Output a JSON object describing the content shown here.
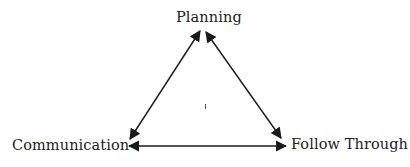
{
  "diagram": {
    "type": "triangle-relationship",
    "nodes": [
      {
        "id": "planning",
        "label": "Planning"
      },
      {
        "id": "communication",
        "label": "Communication"
      },
      {
        "id": "follow_through",
        "label": "Follow Through"
      }
    ],
    "edges": [
      {
        "from": "planning",
        "to": "communication",
        "direction": "bidirectional"
      },
      {
        "from": "planning",
        "to": "follow_through",
        "direction": "bidirectional"
      },
      {
        "from": "communication",
        "to": "follow_through",
        "direction": "bidirectional"
      }
    ],
    "center_mark": "ı",
    "colors": {
      "line": "#1a1a1a",
      "text": "#222222",
      "background": "#ffffff"
    }
  }
}
